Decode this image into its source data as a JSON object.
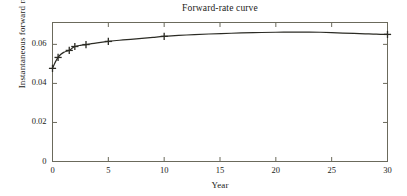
{
  "chart_data": {
    "type": "line",
    "title": "Forward-rate curve",
    "xlabel": "Year",
    "ylabel": "Instantaneous forward rate",
    "xlim": [
      0,
      30
    ],
    "ylim": [
      0,
      0.0712
    ],
    "grid": false,
    "legend": "none",
    "xticks": [
      0,
      5,
      10,
      15,
      20,
      25,
      30
    ],
    "xtick_labels": [
      "0",
      "5",
      "10",
      "15",
      "20",
      "25",
      "30"
    ],
    "yticks": [
      0,
      0.02,
      0.04,
      0.06
    ],
    "ytick_labels": [
      "0",
      "0.02",
      "0.04",
      "0.06"
    ],
    "series": [
      {
        "name": "Instantaneous forward rate",
        "marker": "plus",
        "color": "#2b2b24",
        "x": [
          0,
          0.5,
          1.5,
          2,
          3,
          5,
          10,
          30
        ],
        "values": [
          0.0477,
          0.0533,
          0.0569,
          0.0589,
          0.0599,
          0.0615,
          0.0641,
          0.0651
        ]
      },
      {
        "name": "fitted curve",
        "marker": "none",
        "color": "#2b2b24",
        "x": [
          0,
          0.25,
          0.5,
          0.75,
          1,
          1.25,
          1.5,
          1.75,
          2,
          2.5,
          3,
          3.5,
          4,
          5,
          6,
          7,
          8,
          9,
          10,
          12,
          14,
          16,
          18,
          20,
          21,
          22,
          23,
          24,
          25,
          26,
          27,
          28,
          29,
          30
        ],
        "values": [
          0.0477,
          0.0509,
          0.0533,
          0.0549,
          0.0559,
          0.0565,
          0.0569,
          0.058,
          0.0589,
          0.0595,
          0.0599,
          0.0604,
          0.0608,
          0.0615,
          0.0621,
          0.0626,
          0.0631,
          0.0636,
          0.0641,
          0.0648,
          0.0653,
          0.0657,
          0.066,
          0.0662,
          0.0663,
          0.0663,
          0.0663,
          0.0662,
          0.066,
          0.0658,
          0.0656,
          0.0654,
          0.0652,
          0.0651
        ]
      }
    ]
  },
  "style": {
    "axis_color": "#6b6a5c",
    "curve_color": "#2b2b24",
    "background": "#ffffff"
  }
}
